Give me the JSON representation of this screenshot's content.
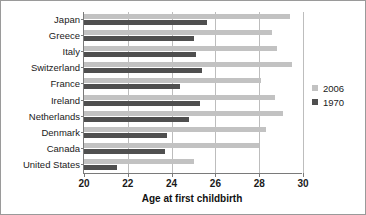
{
  "chart_data": {
    "type": "bar",
    "orientation": "horizontal",
    "title": "",
    "xlabel": "Age at first childbirth",
    "ylabel": "",
    "xlim": [
      20,
      30
    ],
    "xticks": [
      20,
      22,
      24,
      26,
      28,
      30
    ],
    "grid": true,
    "legend_position": "right",
    "categories": [
      "Japan",
      "Greece",
      "Italy",
      "Switzerland",
      "France",
      "Ireland",
      "Netherlands",
      "Denmark",
      "Canada",
      "United States"
    ],
    "series": [
      {
        "name": "2006",
        "color": "#c2c2c2",
        "values": [
          29.4,
          28.6,
          28.8,
          29.5,
          28.1,
          28.7,
          29.1,
          28.3,
          28.0,
          25.0
        ]
      },
      {
        "name": "1970",
        "color": "#4f4f4f",
        "values": [
          25.6,
          25.0,
          25.1,
          25.4,
          24.4,
          25.3,
          24.8,
          23.8,
          23.7,
          21.5
        ]
      }
    ]
  },
  "legend": {
    "entries": [
      {
        "label": "2006",
        "color": "#c2c2c2"
      },
      {
        "label": "1970",
        "color": "#4f4f4f"
      }
    ]
  }
}
